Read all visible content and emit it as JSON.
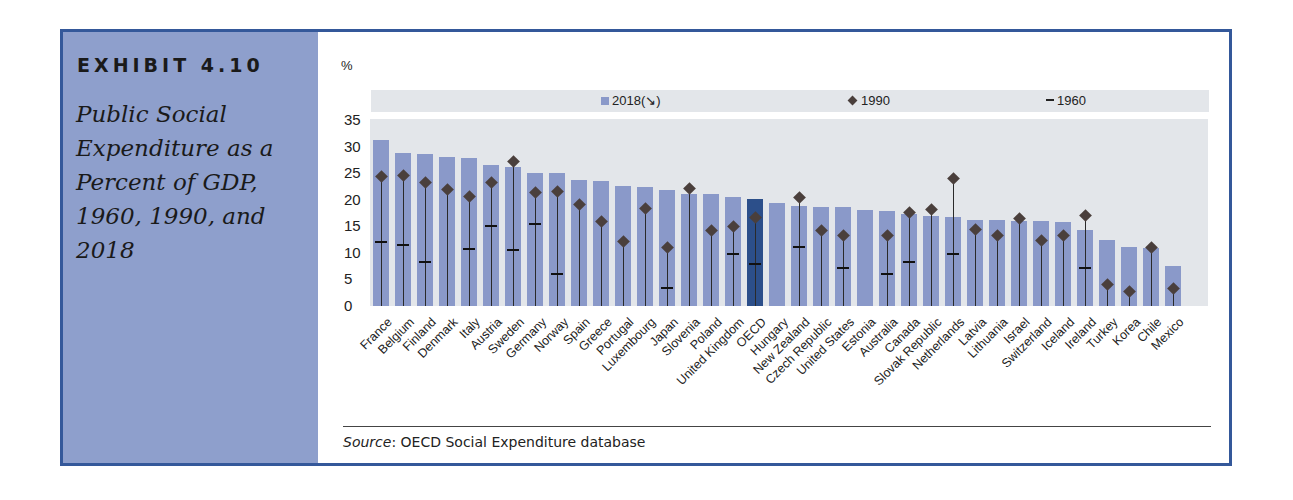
{
  "exhibit": {
    "label": "EXHIBIT 4.10",
    "title": "Public Social Expenditure as a Percent of GDP, 1960, 1990, and 2018"
  },
  "source": {
    "prefix": "Source",
    "text": ": OECD Social Expenditure database"
  },
  "colors": {
    "frame": "#34589a",
    "sidebar": "#8e9fcc",
    "bar": "#8a99c9",
    "bar_highlight": "#2c4f8a",
    "plot_bg": "#e3e6ea",
    "marker": "#4a3f3c"
  },
  "chart_data": {
    "type": "bar",
    "title": "Public Social Expenditure as a Percent of GDP, 1960, 1990, and 2018",
    "ylabel": "%",
    "xlabel": "",
    "ylim": [
      0,
      35
    ],
    "yticks": [
      0,
      5,
      10,
      15,
      20,
      25,
      30,
      35
    ],
    "grid": false,
    "legend": [
      "2018(↘)",
      "1990",
      "1960"
    ],
    "legend_position": "top",
    "highlight": "OECD",
    "categories": [
      "France",
      "Belgium",
      "Finland",
      "Denmark",
      "Italy",
      "Austria",
      "Sweden",
      "Germany",
      "Norway",
      "Spain",
      "Greece",
      "Portugal",
      "Luxembourg",
      "Japan",
      "Slovenia",
      "Poland",
      "United Kingdom",
      "OECD",
      "Hungary",
      "New Zealand",
      "Czech Republic",
      "United States",
      "Estonia",
      "Australia",
      "Canada",
      "Slovak Republic",
      "Netherlands",
      "Latvia",
      "Lithuania",
      "Israel",
      "Switzerland",
      "Iceland",
      "Ireland",
      "Turkey",
      "Korea",
      "Chile",
      "Mexico"
    ],
    "series": [
      {
        "name": "2018",
        "marker": "bar",
        "values": [
          31.2,
          28.9,
          28.7,
          28.0,
          27.9,
          26.6,
          26.1,
          25.1,
          25.0,
          23.7,
          23.5,
          22.6,
          22.4,
          21.9,
          21.1,
          21.1,
          20.6,
          20.1,
          19.4,
          18.9,
          18.7,
          18.7,
          18.1,
          17.8,
          17.3,
          17.0,
          16.7,
          16.2,
          16.2,
          16.0,
          16.0,
          15.9,
          14.4,
          12.5,
          11.1,
          10.9,
          7.5
        ]
      },
      {
        "name": "1990",
        "marker": "diamond",
        "values": [
          24.4,
          24.5,
          23.3,
          22.0,
          20.7,
          23.2,
          27.3,
          21.4,
          21.6,
          19.2,
          15.9,
          12.1,
          18.3,
          11.1,
          22.1,
          14.3,
          14.9,
          16.7,
          null,
          20.4,
          14.3,
          13.3,
          null,
          13.3,
          17.6,
          18.2,
          24.0,
          14.4,
          13.3,
          16.4,
          12.3,
          13.3,
          17.0,
          4.0,
          2.7,
          11.0,
          3.3
        ]
      },
      {
        "name": "1960",
        "marker": "dash",
        "values": [
          12.0,
          11.4,
          8.2,
          null,
          10.8,
          15.0,
          10.5,
          15.4,
          6.0,
          null,
          null,
          null,
          null,
          3.4,
          null,
          null,
          9.8,
          8.0,
          null,
          11.2,
          null,
          7.1,
          null,
          6.0,
          8.3,
          null,
          9.8,
          null,
          null,
          null,
          null,
          null,
          7.1,
          null,
          null,
          null,
          null
        ]
      }
    ]
  }
}
